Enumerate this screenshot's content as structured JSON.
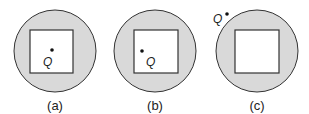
{
  "colors": {
    "ring_fill": "#d9d9d9",
    "stroke": "#333333",
    "inner_fill": "#ffffff",
    "dot": "#111111"
  },
  "panels": [
    {
      "id": "a",
      "caption": "(a)",
      "circle": {
        "cx": 55,
        "cy": 51,
        "r": 41
      },
      "square": {
        "x": 30,
        "y": 30,
        "w": 43,
        "h": 43
      },
      "point": {
        "label": "Q",
        "dot": {
          "x": 52,
          "y": 50
        },
        "text": {
          "x": 43,
          "y": 65
        },
        "location": "inside square, center-right"
      }
    },
    {
      "id": "b",
      "caption": "(b)",
      "circle": {
        "cx": 155,
        "cy": 51,
        "r": 41
      },
      "square": {
        "x": 134,
        "y": 30,
        "w": 44,
        "h": 43
      },
      "point": {
        "label": "Q",
        "dot": {
          "x": 142,
          "y": 51
        },
        "text": {
          "x": 146,
          "y": 65
        },
        "location": "inside square, left"
      }
    },
    {
      "id": "c",
      "caption": "(c)",
      "circle": {
        "cx": 257,
        "cy": 51,
        "r": 41
      },
      "square": {
        "x": 235,
        "y": 30,
        "w": 44,
        "h": 43
      },
      "point": {
        "label": "Q",
        "dot": {
          "x": 226,
          "y": 14
        },
        "text": {
          "x": 213,
          "y": 22
        },
        "location": "outside circle, upper-left"
      }
    }
  ]
}
